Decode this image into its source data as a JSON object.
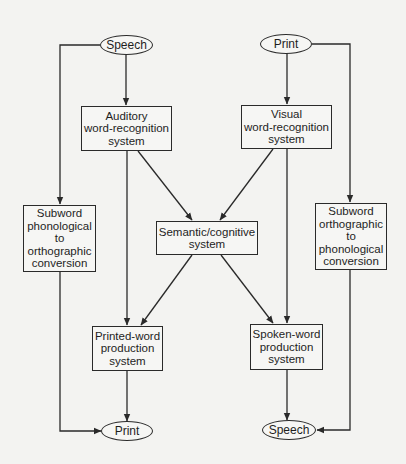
{
  "diagram": {
    "type": "flowchart",
    "title": "",
    "nodes": {
      "speech_in": {
        "label": "Speech",
        "shape": "ellipse"
      },
      "print_in": {
        "label": "Print",
        "shape": "ellipse"
      },
      "auditory": {
        "label": "Auditory\nword-recognition\nsystem",
        "shape": "box"
      },
      "visual": {
        "label": "Visual\nword-recognition\nsystem",
        "shape": "box"
      },
      "subword_po": {
        "label": "Subword\nphonological\nto\northographic\nconversion",
        "shape": "box"
      },
      "semantic": {
        "label": "Semantic/cognitive\nsystem",
        "shape": "box"
      },
      "subword_op": {
        "label": "Subword\northographic\nto\nphonological\nconversion",
        "shape": "box"
      },
      "printed_word": {
        "label": "Printed-word\nproduction\nsystem",
        "shape": "box"
      },
      "spoken_word": {
        "label": "Spoken-word\nproduction\nsystem",
        "shape": "box"
      },
      "print_out": {
        "label": "Print",
        "shape": "ellipse"
      },
      "speech_out": {
        "label": "Speech",
        "shape": "ellipse"
      }
    },
    "edges": [
      {
        "from": "speech_in",
        "to": "auditory"
      },
      {
        "from": "speech_in",
        "to": "subword_po"
      },
      {
        "from": "print_in",
        "to": "visual"
      },
      {
        "from": "print_in",
        "to": "subword_op"
      },
      {
        "from": "auditory",
        "to": "semantic"
      },
      {
        "from": "auditory",
        "to": "printed_word"
      },
      {
        "from": "visual",
        "to": "semantic"
      },
      {
        "from": "visual",
        "to": "spoken_word"
      },
      {
        "from": "semantic",
        "to": "printed_word"
      },
      {
        "from": "semantic",
        "to": "spoken_word"
      },
      {
        "from": "subword_po",
        "to": "print_out"
      },
      {
        "from": "subword_op",
        "to": "speech_out"
      },
      {
        "from": "printed_word",
        "to": "print_out"
      },
      {
        "from": "spoken_word",
        "to": "speech_out"
      }
    ],
    "colors": {
      "line": "#2a2a2a",
      "background": "#f3f3f1"
    }
  }
}
